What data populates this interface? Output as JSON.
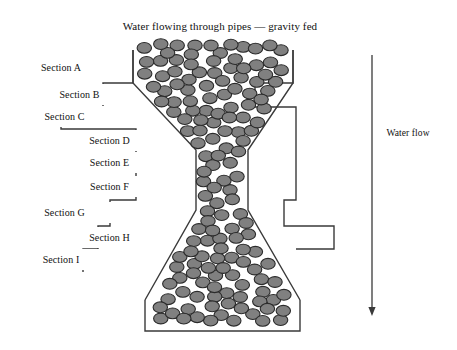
{
  "figure": {
    "width": 457,
    "height": 350,
    "background_color": "#ffffff",
    "line_color": "#3a3a3a",
    "particle_fill_color": "#808080",
    "particle_stroke_color": "#2b2b2b"
  },
  "title": {
    "text": "Water flowing through pipes — gravity fed",
    "x": 55,
    "y": 14,
    "width": 330,
    "height": 24
  },
  "flow_label": {
    "text": "Water flow",
    "x": 374,
    "y": 124,
    "width": 68,
    "height": 20
  },
  "flow_arrow": {
    "name": "downward-arrow",
    "x": 372,
    "y_start": 55,
    "y_end": 316
  },
  "sections": [
    {
      "label": "Section A",
      "x": 18,
      "y": 57,
      "width": 86,
      "height": 21
    },
    {
      "label": "Section B",
      "x": 33,
      "y": 84,
      "width": 93,
      "height": 21
    },
    {
      "label": "Section C",
      "x": 18,
      "y": 106,
      "width": 93,
      "height": 21
    },
    {
      "label": "Section D",
      "x": 63,
      "y": 130,
      "width": 93,
      "height": 21
    },
    {
      "label": "Section E",
      "x": 63,
      "y": 152,
      "width": 93,
      "height": 21
    },
    {
      "label": "Section F",
      "x": 63,
      "y": 176,
      "width": 93,
      "height": 21
    },
    {
      "label": "Section G",
      "x": 18,
      "y": 202,
      "width": 93,
      "height": 21
    },
    {
      "label": "Section H",
      "x": 63,
      "y": 227,
      "width": 93,
      "height": 21
    },
    {
      "label": "Section I",
      "x": 18,
      "y": 249,
      "width": 86,
      "height": 21
    }
  ],
  "pipe": {
    "name": "funnel-pipe-outline",
    "left_outline": "M133,50 L133,83 L103,83 L103,107 L61,107 L61,129 L136,129 L136,200 L110,200 L110,226 L98,226 L98,249 L83,249 L83,272",
    "right_outline": "M293,50 L293,83 L255,83 L255,107 L296,107 L296,129 L296,200 L284,200 L284,226 L334,226 L334,249 L296,249",
    "top_left_x": 133,
    "top_right_x": 293,
    "neck_left_x": 196,
    "neck_right_x": 248,
    "base_left_x": 145,
    "base_right_x": 300,
    "base_bottom_y": 331
  },
  "particles": {
    "count": 178,
    "radius_x": 7.2,
    "radius_y": 5.4,
    "description": "gray elliptical pellets filling the funnel-shaped pipe"
  }
}
